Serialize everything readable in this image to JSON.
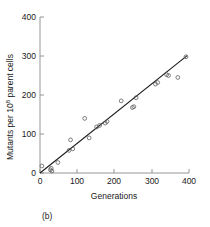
{
  "figure": {
    "panel_label": "(b)",
    "marker": "open-circle",
    "line_color": "#1a1a1a",
    "axis_color": "#8a8a8a",
    "marker_color": "#555555"
  },
  "chart_data": {
    "type": "scatter",
    "title": "",
    "xlabel": "Generations",
    "ylabel": "Mutants per 10⁸ parent cells",
    "ylabel_base": "Mutants per 10",
    "ylabel_exponent": "8",
    "ylabel_tail": " parent cells",
    "xlim": [
      0,
      400
    ],
    "ylim": [
      0,
      400
    ],
    "xticks": [
      0,
      100,
      200,
      300,
      400
    ],
    "yticks": [
      0,
      100,
      200,
      300,
      400
    ],
    "xtick_labels": [
      "0",
      "100",
      "200",
      "300",
      "400"
    ],
    "ytick_labels": [
      "0",
      "100",
      "200",
      "300",
      "400"
    ],
    "grid": false,
    "legend": null,
    "points": [
      {
        "x": 5,
        "y": 18
      },
      {
        "x": 28,
        "y": 8
      },
      {
        "x": 30,
        "y": 12
      },
      {
        "x": 32,
        "y": 5
      },
      {
        "x": 48,
        "y": 27
      },
      {
        "x": 78,
        "y": 58
      },
      {
        "x": 82,
        "y": 85
      },
      {
        "x": 88,
        "y": 62
      },
      {
        "x": 120,
        "y": 140
      },
      {
        "x": 132,
        "y": 90
      },
      {
        "x": 152,
        "y": 118
      },
      {
        "x": 160,
        "y": 122
      },
      {
        "x": 175,
        "y": 128
      },
      {
        "x": 180,
        "y": 132
      },
      {
        "x": 218,
        "y": 185
      },
      {
        "x": 248,
        "y": 168
      },
      {
        "x": 252,
        "y": 170
      },
      {
        "x": 258,
        "y": 193
      },
      {
        "x": 310,
        "y": 228
      },
      {
        "x": 316,
        "y": 232
      },
      {
        "x": 340,
        "y": 252
      },
      {
        "x": 345,
        "y": 250
      },
      {
        "x": 370,
        "y": 245
      },
      {
        "x": 392,
        "y": 298
      }
    ],
    "fit_line": {
      "type": "linear",
      "x": [
        0,
        395
      ],
      "y": [
        0,
        301
      ],
      "slope": 0.762,
      "intercept": 0
    }
  }
}
